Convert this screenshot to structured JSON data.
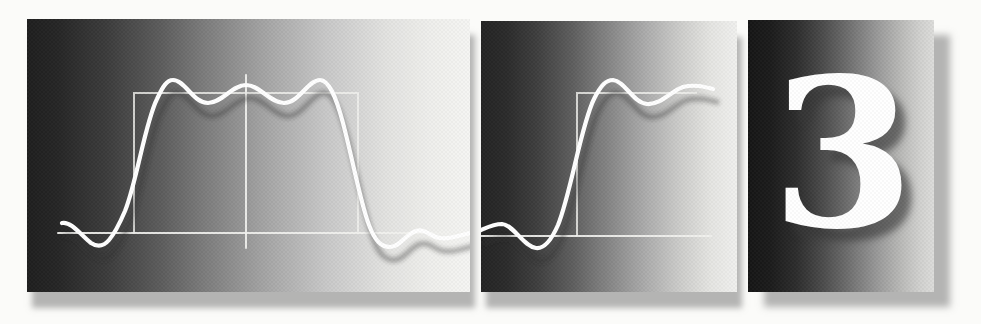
{
  "chapter_number": "3",
  "colors": {
    "page_bg": "#fbfbf9",
    "curve_color": "#ffffff",
    "curve_shadow": "rgba(45,45,45,0.40)",
    "axis_color": "#f2f2ef",
    "numeral_color": "#ffffff",
    "numeral_shadow": "rgba(55,55,55,0.62)",
    "panel_shadow": "rgba(110,110,110,0.50)",
    "p1_dark": "#1f1f1f",
    "p1_light": "#f5f5f3",
    "p2_dark": "#242424",
    "p2_light": "#f0f0ee",
    "p3_dark": "#161616",
    "p3_light": "#dcdcda"
  },
  "figure": {
    "panel1": {
      "curve_path": "M 35 204 C 44 202 54 216 64 224 C 70 228 76 228 82 221 C 88 214 92 206 98 192 C 110 162 118 104 130 80 C 136 67 140 61 146 61 C 158 61 166 84 181 84 C 195 84 205 66 219 66 C 233 66 243 84 257 84 C 272 84 281 61 293 61 C 302 61 309 78 316 104 C 326 142 334 186 342 206 C 348 222 354 228 363 228 C 373 228 379 215 389 212 C 398 209 404 218 413 219 C 423 221 433 216 443 214",
      "baseline_path": "M 31 214 H 443",
      "vertical_axis_path": "M 219 56 V 229",
      "square_outline_path": "M 107 214 V 74 H 331 V 214"
    },
    "panel2": {
      "curve_path": "M 0 209 C 7 206 13 203 21 203 C 33 204 42 225 55 227 C 63 228 70 220 77 204 C 90 172 100 104 113 78 C 120 64 125 59 132 59 C 144 60 152 82 166 83 C 180 84 190 70 202 66 C 214 63 224 66 232 68",
      "baseline_path": "M 0 215 H 230",
      "square_outline_path": "M 96 215 V 72 H 216"
    }
  }
}
